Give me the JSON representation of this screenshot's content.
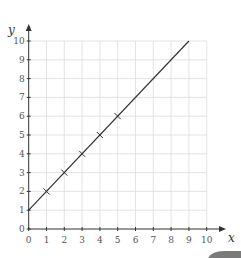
{
  "chart_data": {
    "type": "line",
    "title": "",
    "xlabel": "x",
    "ylabel": "y",
    "xlim": [
      0,
      10
    ],
    "ylim": [
      0,
      10
    ],
    "grid": true,
    "legend": null,
    "x_ticks": [
      "0",
      "1",
      "2",
      "3",
      "4",
      "5",
      "6",
      "7",
      "8",
      "9",
      "10"
    ],
    "y_ticks": [
      "0",
      "1",
      "2",
      "3",
      "4",
      "5",
      "6",
      "7",
      "8",
      "9",
      "10"
    ],
    "series": [
      {
        "name": "line",
        "equation": "y = x + 1",
        "x": [
          0,
          9
        ],
        "y": [
          1,
          10
        ],
        "style": "solid"
      },
      {
        "name": "plotted points",
        "marker": "x",
        "x": [
          1,
          2,
          3,
          4,
          5
        ],
        "y": [
          2,
          3,
          4,
          5,
          6
        ]
      }
    ]
  },
  "colors": {
    "axis": "#333333",
    "grid": "#dddddd",
    "tab": "#7a7a7a"
  }
}
